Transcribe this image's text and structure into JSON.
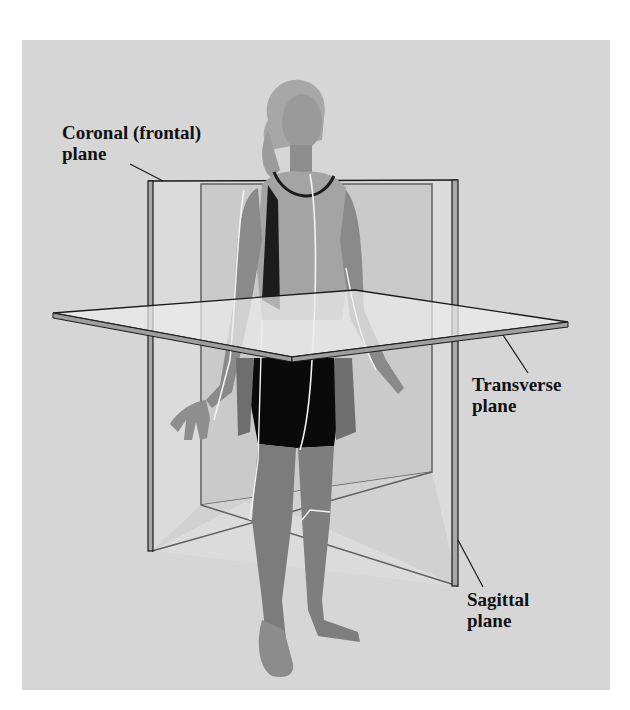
{
  "figure": {
    "colors": {
      "background": "#d6d6d6",
      "plane_fill_light": "#e8e8e8",
      "plane_fill_mid": "#bdbdbd",
      "plane_edge": "#1a1a1a",
      "shorts": "#0a0a0a",
      "skin": "#8a8a8a"
    },
    "labels": {
      "coronal": {
        "line1": "Coronal (frontal)",
        "line2": "plane"
      },
      "transverse": {
        "line1": "Transverse",
        "line2": "plane"
      },
      "sagittal": {
        "line1": "Sagittal",
        "line2": "plane"
      }
    }
  }
}
